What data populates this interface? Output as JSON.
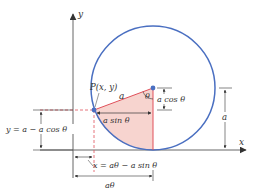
{
  "diagram": {
    "colors": {
      "circle": "#4a6fc1",
      "axis": "#555555",
      "red": "#e0505a",
      "fill": "#f7d4cf",
      "text": "#333333"
    },
    "labels": {
      "y_axis": "y",
      "x_axis": "x",
      "point": "P(x, y)",
      "radius": "a",
      "angle": "θ",
      "a_cos": "a cos θ",
      "a_sin": "a sin θ",
      "y_eq": "y = a − a cos θ",
      "x_eq": "x = aθ − a sin θ",
      "a_theta": "aθ",
      "a_right": "a"
    }
  }
}
